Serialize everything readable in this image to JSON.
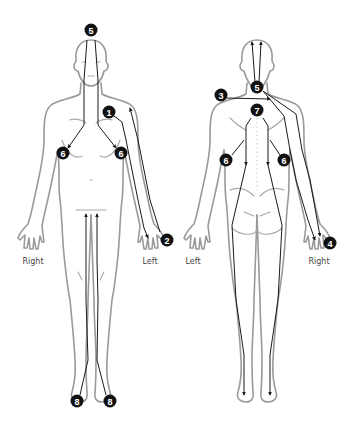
{
  "diagram": {
    "type": "meridian-paths-body-chart",
    "views": [
      {
        "id": "front",
        "side_labels": {
          "left_of_image": "Right",
          "right_of_image": "Left"
        },
        "markers": [
          {
            "label": "5",
            "x": 91,
            "y": 30
          },
          {
            "label": "1",
            "x": 109,
            "y": 112
          },
          {
            "label": "6",
            "x": 63,
            "y": 153
          },
          {
            "label": "6",
            "x": 121,
            "y": 153
          },
          {
            "label": "2",
            "x": 167,
            "y": 240
          },
          {
            "label": "8",
            "x": 77,
            "y": 401
          },
          {
            "label": "8",
            "x": 110,
            "y": 401
          }
        ]
      },
      {
        "id": "back",
        "side_labels": {
          "left_of_image": "Left",
          "right_of_image": "Right"
        },
        "markers": [
          {
            "label": "5",
            "x": 257,
            "y": 87
          },
          {
            "label": "3",
            "x": 221,
            "y": 95
          },
          {
            "label": "7",
            "x": 257,
            "y": 110
          },
          {
            "label": "6",
            "x": 226,
            "y": 160
          },
          {
            "label": "6",
            "x": 284,
            "y": 160
          },
          {
            "label": "4",
            "x": 330,
            "y": 243
          }
        ]
      }
    ]
  }
}
